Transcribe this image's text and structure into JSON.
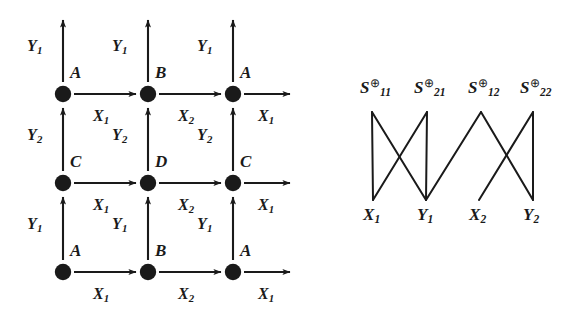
{
  "figure": {
    "name": "two-panel-figure",
    "panels": [
      "transition-grid",
      "crossing-bipartite"
    ]
  },
  "left_diagram": {
    "name": "transition-grid",
    "node_labels": [
      {
        "text": "A",
        "row": 0,
        "col": 0
      },
      {
        "text": "B",
        "row": 0,
        "col": 1
      },
      {
        "text": "A",
        "row": 0,
        "col": 2
      },
      {
        "text": "C",
        "row": 1,
        "col": 0
      },
      {
        "text": "D",
        "row": 1,
        "col": 1
      },
      {
        "text": "C",
        "row": 1,
        "col": 2
      },
      {
        "text": "A",
        "row": 2,
        "col": 0
      },
      {
        "text": "B",
        "row": 2,
        "col": 1
      },
      {
        "text": "A",
        "row": 2,
        "col": 2
      }
    ],
    "horizontal_edge_labels": [
      {
        "base": "X",
        "sub": "1",
        "row": 0,
        "col": 0
      },
      {
        "base": "X",
        "sub": "2",
        "row": 0,
        "col": 1
      },
      {
        "base": "X",
        "sub": "1",
        "row": 0,
        "col": 2
      },
      {
        "base": "X",
        "sub": "1",
        "row": 1,
        "col": 0
      },
      {
        "base": "X",
        "sub": "2",
        "row": 1,
        "col": 1
      },
      {
        "base": "X",
        "sub": "1",
        "row": 1,
        "col": 2
      },
      {
        "base": "X",
        "sub": "1",
        "row": 2,
        "col": 0
      },
      {
        "base": "X",
        "sub": "2",
        "row": 2,
        "col": 1
      },
      {
        "base": "X",
        "sub": "1",
        "row": 2,
        "col": 2
      }
    ],
    "vertical_edge_labels": [
      {
        "base": "Y",
        "sub": "1",
        "row": 0,
        "col": 0
      },
      {
        "base": "Y",
        "sub": "1",
        "row": 0,
        "col": 1
      },
      {
        "base": "Y",
        "sub": "1",
        "row": 0,
        "col": 2
      },
      {
        "base": "Y",
        "sub": "2",
        "row": 1,
        "col": 0
      },
      {
        "base": "Y",
        "sub": "2",
        "row": 1,
        "col": 1
      },
      {
        "base": "Y",
        "sub": "2",
        "row": 1,
        "col": 2
      },
      {
        "base": "Y",
        "sub": "1",
        "row": 2,
        "col": 0
      },
      {
        "base": "Y",
        "sub": "1",
        "row": 2,
        "col": 1
      },
      {
        "base": "Y",
        "sub": "1",
        "row": 2,
        "col": 2
      }
    ]
  },
  "right_diagram": {
    "name": "crossing-bipartite",
    "top_nodes": [
      {
        "base": "S",
        "sub": "11",
        "sup": "⊕"
      },
      {
        "base": "S",
        "sub": "21",
        "sup": "⊕"
      },
      {
        "base": "S",
        "sub": "12",
        "sup": "⊕"
      },
      {
        "base": "S",
        "sub": "22",
        "sup": "⊕"
      }
    ],
    "bottom_nodes": [
      {
        "base": "X",
        "sub": "1"
      },
      {
        "base": "Y",
        "sub": "1"
      },
      {
        "base": "X",
        "sub": "2"
      },
      {
        "base": "Y",
        "sub": "2"
      }
    ],
    "edges": [
      {
        "from": "S11",
        "to": "X1"
      },
      {
        "from": "S11",
        "to": "Y1"
      },
      {
        "from": "S21",
        "to": "X1"
      },
      {
        "from": "S21",
        "to": "Y1"
      },
      {
        "from": "S12",
        "to": "X2"
      },
      {
        "from": "S12",
        "to": "Y2"
      },
      {
        "from": "S22",
        "to": "X2"
      },
      {
        "from": "S22",
        "to": "Y2"
      }
    ]
  },
  "style": {
    "ink": "#1a1a1a",
    "paper": "#ffffff"
  }
}
